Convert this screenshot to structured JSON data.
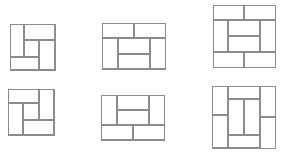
{
  "canvas": {
    "width": 281,
    "height": 152,
    "background": "#ffffff",
    "line_color": "#8c8c8c"
  },
  "figures": [
    {
      "id": "fig-1",
      "description": "square pinwheel tiling, clockwise",
      "box": {
        "x": 10,
        "y": 24,
        "w": 46,
        "h": 47
      },
      "tiles": [
        {
          "x": 0,
          "y": 0,
          "w": 0.31,
          "h": 0.72
        },
        {
          "x": 0.31,
          "y": 0,
          "w": 0.69,
          "h": 0.36
        },
        {
          "x": 0.65,
          "y": 0.36,
          "w": 0.35,
          "h": 0.64
        },
        {
          "x": 0,
          "y": 0.72,
          "w": 0.65,
          "h": 0.28
        },
        {
          "x": 0.31,
          "y": 0.36,
          "w": 0.34,
          "h": 0.36
        }
      ]
    },
    {
      "id": "fig-2",
      "description": "4x3 rectangle tiling, two horizontals on top",
      "box": {
        "x": 102,
        "y": 23,
        "w": 64,
        "h": 47
      },
      "tiles": [
        {
          "x": 0,
          "y": 0,
          "w": 0.5,
          "h": 0.33
        },
        {
          "x": 0.5,
          "y": 0,
          "w": 0.5,
          "h": 0.33
        },
        {
          "x": 0,
          "y": 0.33,
          "w": 0.25,
          "h": 0.67
        },
        {
          "x": 0.75,
          "y": 0.33,
          "w": 0.25,
          "h": 0.67
        },
        {
          "x": 0.25,
          "y": 0.33,
          "w": 0.5,
          "h": 0.34
        },
        {
          "x": 0.25,
          "y": 0.67,
          "w": 0.5,
          "h": 0.33
        }
      ]
    },
    {
      "id": "fig-3",
      "description": "4x4 square tiling, horizontals on top and bottom",
      "box": {
        "x": 213,
        "y": 5,
        "w": 63,
        "h": 63
      },
      "tiles": [
        {
          "x": 0,
          "y": 0,
          "w": 0.5,
          "h": 0.25
        },
        {
          "x": 0.5,
          "y": 0,
          "w": 0.5,
          "h": 0.25
        },
        {
          "x": 0,
          "y": 0.25,
          "w": 0.25,
          "h": 0.5
        },
        {
          "x": 0.75,
          "y": 0.25,
          "w": 0.25,
          "h": 0.5
        },
        {
          "x": 0.25,
          "y": 0.25,
          "w": 0.5,
          "h": 0.25
        },
        {
          "x": 0.25,
          "y": 0.5,
          "w": 0.5,
          "h": 0.25
        },
        {
          "x": 0,
          "y": 0.75,
          "w": 0.5,
          "h": 0.25
        },
        {
          "x": 0.5,
          "y": 0.75,
          "w": 0.5,
          "h": 0.25
        }
      ]
    },
    {
      "id": "fig-4",
      "description": "square pinwheel tiling, counter-clockwise",
      "box": {
        "x": 8,
        "y": 89,
        "w": 47,
        "h": 47
      },
      "tiles": [
        {
          "x": 0,
          "y": 0,
          "w": 0.66,
          "h": 0.3
        },
        {
          "x": 0.66,
          "y": 0,
          "w": 0.34,
          "h": 0.68
        },
        {
          "x": 0.34,
          "y": 0.68,
          "w": 0.66,
          "h": 0.32
        },
        {
          "x": 0,
          "y": 0.3,
          "w": 0.34,
          "h": 0.7
        },
        {
          "x": 0.34,
          "y": 0.3,
          "w": 0.32,
          "h": 0.38
        }
      ]
    },
    {
      "id": "fig-5",
      "description": "4x3 rectangle tiling, two horizontals on bottom",
      "box": {
        "x": 101,
        "y": 95,
        "w": 64,
        "h": 46
      },
      "tiles": [
        {
          "x": 0,
          "y": 0,
          "w": 0.25,
          "h": 0.67
        },
        {
          "x": 0.75,
          "y": 0,
          "w": 0.25,
          "h": 0.67
        },
        {
          "x": 0.25,
          "y": 0,
          "w": 0.5,
          "h": 0.33
        },
        {
          "x": 0.25,
          "y": 0.33,
          "w": 0.5,
          "h": 0.34
        },
        {
          "x": 0,
          "y": 0.67,
          "w": 0.5,
          "h": 0.33
        },
        {
          "x": 0.5,
          "y": 0.67,
          "w": 0.5,
          "h": 0.33
        }
      ]
    },
    {
      "id": "fig-6",
      "description": "4x4 square tiling, verticals on left and right",
      "box": {
        "x": 212,
        "y": 86,
        "w": 64,
        "h": 63
      },
      "tiles": [
        {
          "x": 0,
          "y": 0,
          "w": 0.25,
          "h": 0.47
        },
        {
          "x": 0,
          "y": 0.47,
          "w": 0.25,
          "h": 0.53
        },
        {
          "x": 0.75,
          "y": 0,
          "w": 0.25,
          "h": 0.5
        },
        {
          "x": 0.75,
          "y": 0.5,
          "w": 0.25,
          "h": 0.5
        },
        {
          "x": 0.25,
          "y": 0,
          "w": 0.5,
          "h": 0.22
        },
        {
          "x": 0.25,
          "y": 0.22,
          "w": 0.25,
          "h": 0.56
        },
        {
          "x": 0.5,
          "y": 0.22,
          "w": 0.25,
          "h": 0.56
        },
        {
          "x": 0.25,
          "y": 0.78,
          "w": 0.5,
          "h": 0.22
        }
      ]
    }
  ]
}
